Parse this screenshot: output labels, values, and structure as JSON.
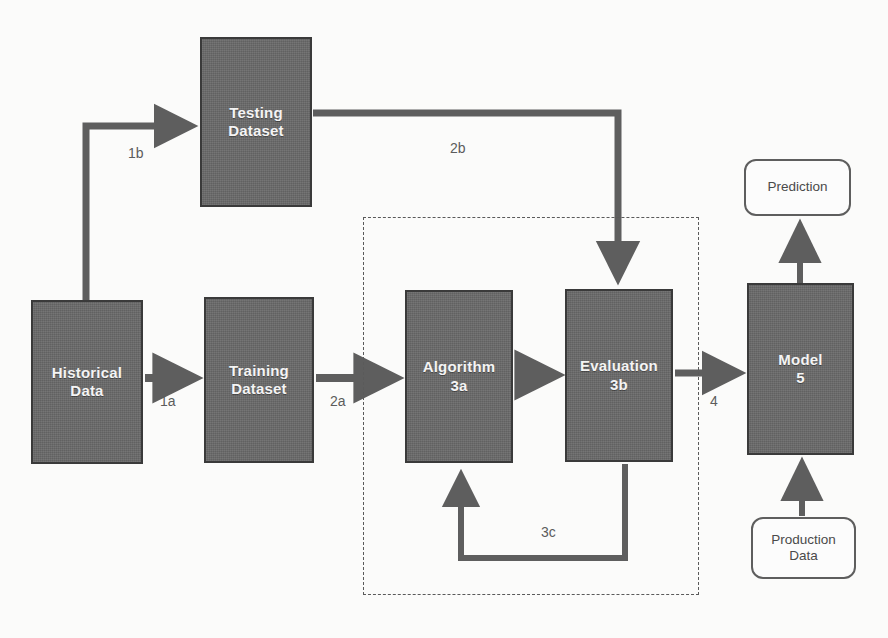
{
  "diagram": {
    "background_color": "#fbfbfa",
    "node_fill_color": "#6a6a6a",
    "node_border_color": "#3a3a3a",
    "node_text_color": "#f4f4f4",
    "arrow_color": "#5e5e5e",
    "label_color": "#5c5c5c",
    "rounded_fill_color": "#fcfcfc",
    "nodes": [
      {
        "id": "testing-dataset",
        "shape": "rectangle",
        "style": "filled",
        "lines": [
          "Testing",
          "Dataset"
        ],
        "x": 200,
        "y": 37,
        "w": 112,
        "h": 170
      },
      {
        "id": "historical-data",
        "shape": "rectangle",
        "style": "filled",
        "lines": [
          "Historical",
          "Data"
        ],
        "x": 31,
        "y": 300,
        "w": 112,
        "h": 164
      },
      {
        "id": "training-dataset",
        "shape": "rectangle",
        "style": "filled",
        "lines": [
          "Training",
          "Dataset"
        ],
        "x": 204,
        "y": 297,
        "w": 110,
        "h": 166
      },
      {
        "id": "algorithm",
        "shape": "rectangle",
        "style": "filled",
        "lines": [
          "Algorithm",
          "3a"
        ],
        "x": 405,
        "y": 290,
        "w": 108,
        "h": 173
      },
      {
        "id": "evaluation",
        "shape": "rectangle",
        "style": "filled",
        "lines": [
          "Evaluation",
          "3b"
        ],
        "x": 565,
        "y": 289,
        "w": 108,
        "h": 173
      },
      {
        "id": "model",
        "shape": "rectangle",
        "style": "filled",
        "lines": [
          "Model",
          "5"
        ],
        "x": 747,
        "y": 283,
        "w": 107,
        "h": 172
      },
      {
        "id": "prediction",
        "shape": "rounded-rectangle",
        "style": "outline",
        "lines": [
          "Prediction"
        ],
        "x": 744,
        "y": 159,
        "w": 107,
        "h": 57
      },
      {
        "id": "production-data",
        "shape": "rounded-rectangle",
        "style": "outline",
        "lines": [
          "Production",
          "Data"
        ],
        "x": 751,
        "y": 517,
        "w": 105,
        "h": 62
      }
    ],
    "groups": [
      {
        "id": "training-loop-group",
        "style": "dashed",
        "label": "",
        "x": 363,
        "y": 217,
        "w": 336,
        "h": 378
      }
    ],
    "edges": [
      {
        "id": "edge-1a",
        "label": "1a",
        "from": "historical-data",
        "to": "training-dataset",
        "label_x": 160,
        "label_y": 393
      },
      {
        "id": "edge-1b",
        "label": "1b",
        "from": "historical-data",
        "to": "testing-dataset",
        "label_x": 128,
        "label_y": 145
      },
      {
        "id": "edge-2a",
        "label": "2a",
        "from": "training-dataset",
        "to": "algorithm",
        "label_x": 330,
        "label_y": 393
      },
      {
        "id": "edge-2b",
        "label": "2b",
        "from": "testing-dataset",
        "to": "evaluation",
        "label_x": 450,
        "label_y": 140
      },
      {
        "id": "edge-3a-3b",
        "label": "",
        "from": "algorithm",
        "to": "evaluation",
        "label_x": 0,
        "label_y": 0
      },
      {
        "id": "edge-3c",
        "label": "3c",
        "from": "evaluation",
        "to": "algorithm",
        "label_x": 541,
        "label_y": 524
      },
      {
        "id": "edge-4",
        "label": "4",
        "from": "evaluation",
        "to": "model",
        "label_x": 710,
        "label_y": 393
      },
      {
        "id": "edge-5",
        "label": "",
        "from": "model",
        "to": "prediction",
        "label_x": 0,
        "label_y": 0
      },
      {
        "id": "edge-production",
        "label": "",
        "from": "production-data",
        "to": "model",
        "label_x": 0,
        "label_y": 0
      }
    ]
  }
}
